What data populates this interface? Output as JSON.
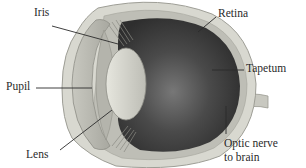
{
  "diagram": {
    "labels": {
      "iris": "Iris",
      "pupil": "Pupil",
      "lens": "Lens",
      "retina": "Retina",
      "tapetum": "Tapetum",
      "optic_nerve_line1": "Optic nerve",
      "optic_nerve_line2": "to brain"
    },
    "colors": {
      "sclera_outer": "#d8d8d2",
      "sclera_inner": "#bdbdb6",
      "interior_dark": "#3a3a3a",
      "tapetum_highlight": "#6a6a6a",
      "lens": "#d4d4cc",
      "cornea": "#c9c9c2",
      "leader_line": "#2a2a2a"
    }
  }
}
